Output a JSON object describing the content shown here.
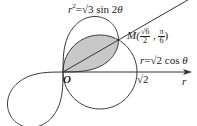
{
  "diagram": {
    "type": "polar-curves",
    "origin_px": [
      63,
      72
    ],
    "scale_px_per_unit": 52.3,
    "colors": {
      "stroke": "#333333",
      "shade": "#c8c8c8",
      "background": "#ffffff"
    },
    "curves": [
      {
        "name": "lemniscate",
        "equation": "r²=√3 sin 2θ"
      },
      {
        "name": "circle",
        "equation": "r=√2 cos θ"
      }
    ],
    "ray_angle": "π/6"
  },
  "labels": {
    "lemniscate_eq_r": "r",
    "lemniscate_eq_sup": "2",
    "lemniscate_eq_rest": "=√3 sin 2",
    "theta": "θ",
    "circle_eq_r": "r",
    "circle_eq_rest": "=√2 cos ",
    "point_M": "M(",
    "M_r_num": "√6",
    "M_r_den": "2",
    "M_sep": " , ",
    "M_t_num": "π",
    "M_t_den": "6",
    "M_close": ")",
    "origin": "O",
    "sqrt2": "√2",
    "axis": "r"
  }
}
